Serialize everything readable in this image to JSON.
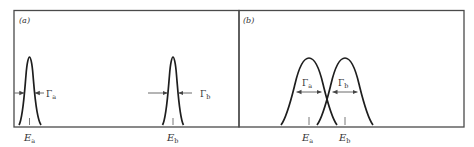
{
  "figure": {
    "panels": [
      {
        "id": "a",
        "label": "(a)",
        "description": "Two narrow, well-separated resonance lines",
        "peaks": [
          {
            "name": "a",
            "energy_label": "E",
            "energy_sub": "a",
            "width_label": "Γ",
            "width_sub": "a",
            "width_label_position": "outside-right"
          },
          {
            "name": "b",
            "energy_label": "E",
            "energy_sub": "b",
            "width_label": "Γ",
            "width_sub": "b",
            "width_label_position": "outside-right"
          }
        ]
      },
      {
        "id": "b",
        "label": "(b)",
        "description": "Two broad, overlapping resonance lines",
        "peaks": [
          {
            "name": "a",
            "energy_label": "E",
            "energy_sub": "a",
            "width_label": "Γ",
            "width_sub": "a",
            "width_label_position": "inside-above"
          },
          {
            "name": "b",
            "energy_label": "E",
            "energy_sub": "b",
            "width_label": "Γ",
            "width_sub": "b",
            "width_label_position": "inside-above"
          }
        ]
      }
    ]
  }
}
